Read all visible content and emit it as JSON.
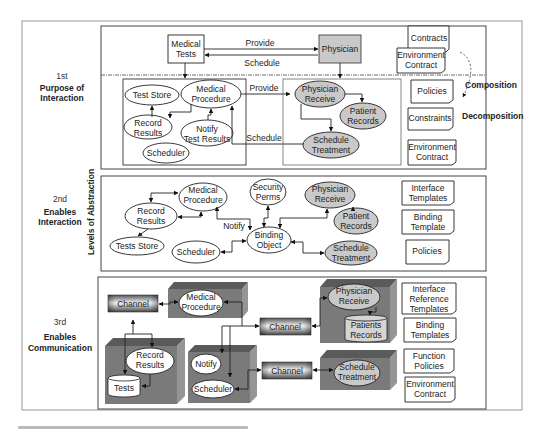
{
  "axis_label": "Levels of Abstraction",
  "side_labels": {
    "composition": "Composition",
    "decomposition": "Decomposition"
  },
  "levels": [
    {
      "num": "1st",
      "name_line1": "Purpose of",
      "name_line2": "Interaction"
    },
    {
      "num": "2nd",
      "name_line1": "Enables",
      "name_line2": "Interaction"
    },
    {
      "num": "3rd",
      "name_line1": "Enables",
      "name_line2": "Communication"
    }
  ],
  "level1": {
    "top": {
      "medical_tests": [
        "Medical",
        "Tests"
      ],
      "physician": "Physician",
      "provide": "Provide",
      "schedule": "Schedule"
    },
    "left_nodes": {
      "test_store": "Test Store",
      "medical_procedure": [
        "Medical",
        "Procedure"
      ],
      "record_results": [
        "Record",
        "Results"
      ],
      "notify": [
        "Notify",
        "Test Results"
      ],
      "scheduler": "Scheduler"
    },
    "right_nodes": {
      "physician_receive": [
        "Physician",
        "Receive"
      ],
      "patient_records": [
        "Patient",
        "Records"
      ],
      "schedule_treatment": [
        "Schedule",
        "Treatment"
      ]
    },
    "provide": "Provide",
    "schedule": "Schedule",
    "notes": {
      "contracts": "Contracts",
      "env_contract_top": [
        "Environment",
        "Contract"
      ],
      "policies": "Policies",
      "constraints": "Constraints",
      "env_contract": [
        "Environment",
        "Contract"
      ]
    }
  },
  "level2": {
    "medical_procedure": [
      "Medical",
      "Procedure"
    ],
    "record_results": [
      "Record",
      "Results"
    ],
    "tests_store": "Tests Store",
    "notify": "Notify",
    "scheduler": "Scheduler",
    "security_perms": [
      "Security",
      "Perms"
    ],
    "binding_object": [
      "Binding",
      "Object"
    ],
    "physician_receive": [
      "Physician",
      "Receive"
    ],
    "patient_records": [
      "Patient",
      "Records"
    ],
    "schedule_treatment": [
      "Schedule",
      "Treatment"
    ],
    "notes": {
      "interface_templates": [
        "Interface",
        "Templates"
      ],
      "binding_template": [
        "Binding",
        "Template"
      ],
      "policies": "Policies"
    }
  },
  "level3": {
    "channel_1": "Channel",
    "channel_2": "Channel",
    "channel_3": "Channel",
    "medical_procedure": [
      "Medical",
      "Procedure"
    ],
    "record_results": [
      "Record",
      "Results"
    ],
    "tests": "Tests",
    "notify": "Notify",
    "scheduler": "Scheduler",
    "physician_receive": [
      "Physician",
      "Receive"
    ],
    "patients_records": [
      "Patients",
      "Records"
    ],
    "schedule_treatment": [
      "Schedule",
      "Treatment"
    ],
    "notes": {
      "interface_reference_templates": [
        "Interface",
        "Reference",
        "Templates"
      ],
      "binding_templates": [
        "Binding",
        "Templates"
      ],
      "function_policies": [
        "Function",
        "Policies"
      ],
      "env_contract": [
        "Environment",
        "Contract"
      ]
    }
  },
  "colors": {
    "gray_node": "#c9c9c9",
    "block_face": "#7a7a7a",
    "block_top": "#5a5a5a",
    "block_side": "#959595"
  }
}
